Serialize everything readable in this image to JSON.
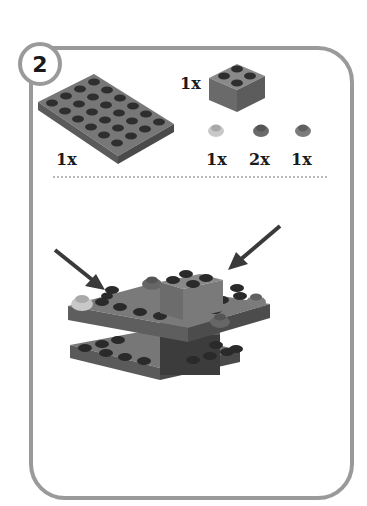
{
  "step": {
    "number": "2"
  },
  "parts": [
    {
      "name": "plate 4x6",
      "color": "#6e6e6e",
      "quantity": "1x"
    },
    {
      "name": "brick 2x2",
      "color": "#7a7a7a",
      "quantity": "1x"
    },
    {
      "name": "round plate 1x1 transparent",
      "color": "#c4c4c4",
      "quantity": "1x"
    },
    {
      "name": "round plate 1x1",
      "color": "#6a6a6a",
      "quantity": "2x"
    },
    {
      "name": "round plate 1x1",
      "color": "#7c7c7c",
      "quantity": "1x"
    }
  ],
  "colors": {
    "frame": "#9a9a9a",
    "plate": "#6e6e6e",
    "stud": "#2c2c2c",
    "dark_brick": "#3c3c3c",
    "arrow": "#3a3a3a"
  }
}
